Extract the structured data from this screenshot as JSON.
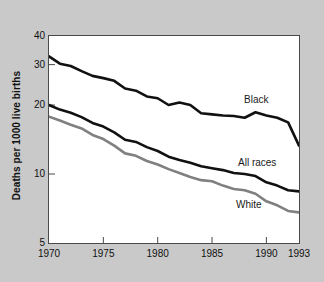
{
  "chart_data": {
    "type": "line",
    "title": "",
    "xlabel": "",
    "ylabel": "Deaths per 1000 live births",
    "yscale": "log",
    "ylim": [
      5,
      40
    ],
    "xlim": [
      1970,
      1993
    ],
    "grid": false,
    "legend_position": "inline-annotations",
    "ytick_labels": [
      "40",
      "30",
      "20",
      "10",
      "5"
    ],
    "ytick_values": [
      40,
      30,
      20,
      10,
      5
    ],
    "xtick_labels": [
      "1970",
      "1975",
      "1980",
      "1985",
      "1990",
      "1993"
    ],
    "xtick_values": [
      1970,
      1975,
      1980,
      1985,
      1990,
      1993
    ],
    "x": [
      1970,
      1971,
      1972,
      1973,
      1974,
      1975,
      1976,
      1977,
      1978,
      1979,
      1980,
      1981,
      1982,
      1983,
      1984,
      1985,
      1986,
      1987,
      1988,
      1989,
      1990,
      1991,
      1992,
      1993
    ],
    "series": [
      {
        "name": "Black",
        "color": "#111111",
        "values": [
          32.6,
          30.3,
          29.6,
          28.1,
          26.8,
          26.2,
          25.5,
          23.6,
          23.1,
          21.8,
          21.4,
          20.0,
          20.5,
          20.0,
          18.4,
          18.2,
          18.0,
          17.9,
          17.6,
          18.6,
          18.0,
          17.6,
          16.8,
          13.3
        ]
      },
      {
        "name": "All races",
        "color": "#111111",
        "values": [
          20.0,
          19.1,
          18.5,
          17.7,
          16.7,
          16.1,
          15.2,
          14.1,
          13.8,
          13.1,
          12.6,
          11.9,
          11.5,
          11.2,
          10.8,
          10.6,
          10.4,
          10.1,
          10.0,
          9.8,
          9.2,
          8.9,
          8.5,
          8.4
        ]
      },
      {
        "name": "White",
        "color": "#808080",
        "values": [
          17.8,
          17.1,
          16.4,
          15.8,
          14.8,
          14.2,
          13.3,
          12.3,
          12.0,
          11.4,
          11.0,
          10.5,
          10.1,
          9.7,
          9.4,
          9.3,
          8.9,
          8.6,
          8.5,
          8.2,
          7.6,
          7.3,
          6.9,
          6.8
        ]
      }
    ]
  },
  "annotations": {
    "black_label": "Black",
    "all_races_label": "All races",
    "white_label": "White"
  }
}
